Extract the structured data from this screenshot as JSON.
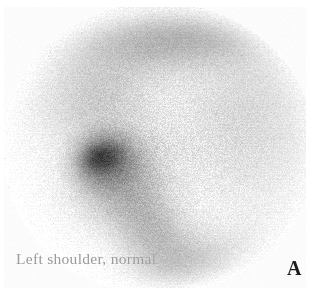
{
  "figure": {
    "modality": "bone-scintigraphy",
    "caption": "Left shoulder, normal",
    "panel_letter": "A",
    "width": 319,
    "height": 297,
    "background_color": "#ffffff",
    "caption_color": "#9a9a9a",
    "panel_letter_color": "#1d1d1d"
  },
  "scan": {
    "field_of_view": {
      "shape": "circle",
      "center_x": 158,
      "center_y": 148,
      "radius_x": 152,
      "radius_y": 142
    },
    "background_tone": "#f2f2f2",
    "noise": {
      "type": "speckle",
      "density": 0.55,
      "amplitude": 34,
      "seed": 20240517
    },
    "uptake_regions": [
      {
        "name": "glenohumeral-focus",
        "cx": 103,
        "cy": 158,
        "rx": 30,
        "ry": 26,
        "intensity": 0.74,
        "rotation": -18
      },
      {
        "name": "glenohumeral-core",
        "cx": 101,
        "cy": 157,
        "rx": 16,
        "ry": 12,
        "intensity": 0.9,
        "rotation": -14
      },
      {
        "name": "humeral-head-halo",
        "cx": 118,
        "cy": 172,
        "rx": 54,
        "ry": 48,
        "intensity": 0.38,
        "rotation": -30
      },
      {
        "name": "humeral-shaft-band",
        "cx": 150,
        "cy": 228,
        "rx": 40,
        "ry": 62,
        "intensity": 0.3,
        "rotation": -38
      },
      {
        "name": "acromion-band",
        "cx": 170,
        "cy": 40,
        "rx": 104,
        "ry": 34,
        "intensity": 0.3,
        "rotation": -4
      },
      {
        "name": "scapular-spine-shade",
        "cx": 96,
        "cy": 96,
        "rx": 66,
        "ry": 50,
        "intensity": 0.2,
        "rotation": -24
      },
      {
        "name": "lateral-soft-tissue",
        "cx": 240,
        "cy": 120,
        "rx": 78,
        "ry": 96,
        "intensity": 0.12,
        "rotation": 8
      },
      {
        "name": "inferior-margin-shade",
        "cx": 196,
        "cy": 262,
        "rx": 70,
        "ry": 34,
        "intensity": 0.16,
        "rotation": -12
      }
    ]
  }
}
